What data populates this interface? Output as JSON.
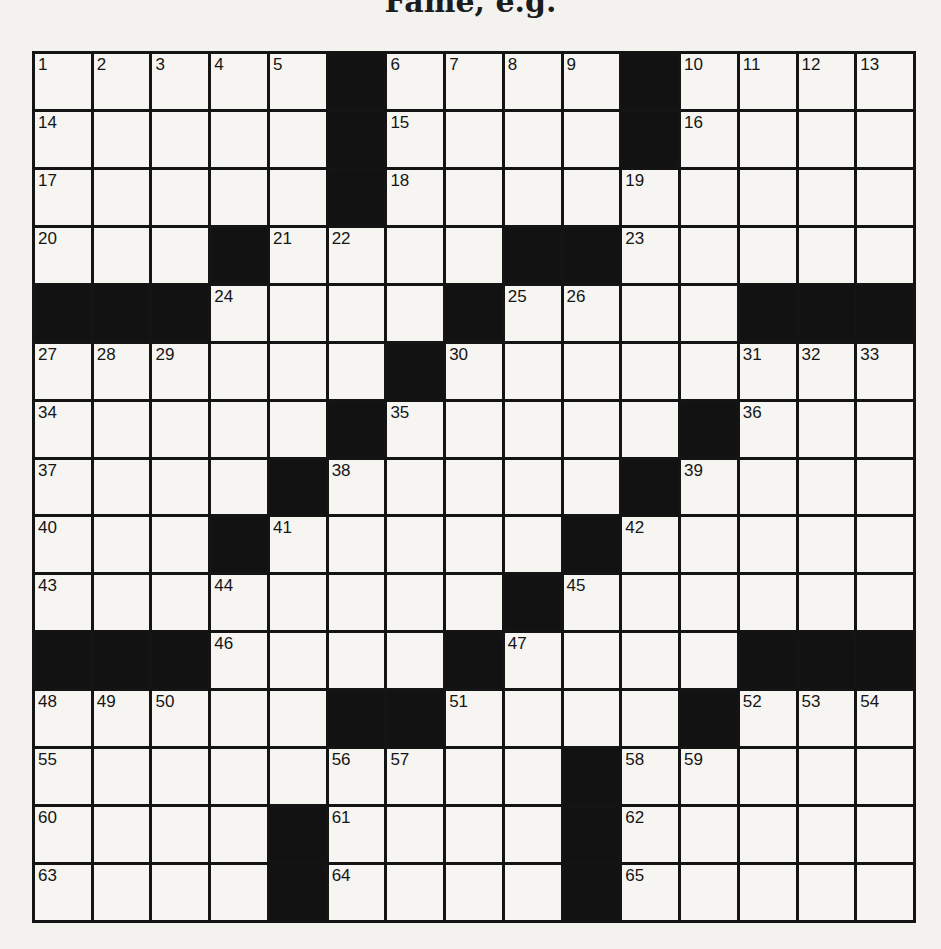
{
  "title": "Fame, e.g.",
  "puzzle": {
    "size": 15,
    "colors": {
      "block": "#121212",
      "cell": "#f6f5f2",
      "line": "#141414"
    },
    "rows": [
      "11111#1111#1111",
      "11111#1111#1111",
      "11111#111111111",
      "111#1111##11111",
      "###11111#1111###",
      "111111#11111111",
      "11111#11111#111",
      "1111#11111#1111",
      "111#11111#11111",
      "11111111#111111",
      "###1111#1111###",
      "11111##1111#111",
      "111111111#11111",
      "1111#1111#11111",
      "1111#1111#11111"
    ],
    "numbers": [
      [
        0,
        0,
        1
      ],
      [
        0,
        1,
        2
      ],
      [
        0,
        2,
        3
      ],
      [
        0,
        3,
        4
      ],
      [
        0,
        4,
        5
      ],
      [
        0,
        6,
        6
      ],
      [
        0,
        7,
        7
      ],
      [
        0,
        8,
        8
      ],
      [
        0,
        9,
        9
      ],
      [
        0,
        11,
        10
      ],
      [
        0,
        12,
        11
      ],
      [
        0,
        13,
        12
      ],
      [
        0,
        14,
        13
      ],
      [
        1,
        0,
        14
      ],
      [
        1,
        6,
        15
      ],
      [
        1,
        11,
        16
      ],
      [
        2,
        0,
        17
      ],
      [
        2,
        6,
        18
      ],
      [
        2,
        10,
        19
      ],
      [
        3,
        0,
        20
      ],
      [
        3,
        4,
        21
      ],
      [
        3,
        5,
        22
      ],
      [
        3,
        10,
        23
      ],
      [
        4,
        3,
        24
      ],
      [
        4,
        8,
        25
      ],
      [
        4,
        9,
        26
      ],
      [
        5,
        0,
        27
      ],
      [
        5,
        1,
        28
      ],
      [
        5,
        2,
        29
      ],
      [
        5,
        7,
        30
      ],
      [
        5,
        12,
        31
      ],
      [
        5,
        13,
        32
      ],
      [
        5,
        14,
        33
      ],
      [
        6,
        0,
        34
      ],
      [
        6,
        6,
        35
      ],
      [
        6,
        12,
        36
      ],
      [
        7,
        0,
        37
      ],
      [
        7,
        5,
        38
      ],
      [
        7,
        11,
        39
      ],
      [
        8,
        0,
        40
      ],
      [
        8,
        4,
        41
      ],
      [
        8,
        10,
        42
      ],
      [
        9,
        0,
        43
      ],
      [
        9,
        3,
        44
      ],
      [
        9,
        9,
        45
      ],
      [
        10,
        3,
        46
      ],
      [
        10,
        8,
        47
      ],
      [
        11,
        0,
        48
      ],
      [
        11,
        1,
        49
      ],
      [
        11,
        2,
        50
      ],
      [
        11,
        7,
        51
      ],
      [
        11,
        12,
        52
      ],
      [
        11,
        13,
        53
      ],
      [
        11,
        14,
        54
      ],
      [
        12,
        0,
        55
      ],
      [
        12,
        5,
        56
      ],
      [
        12,
        6,
        57
      ],
      [
        12,
        10,
        58
      ],
      [
        12,
        11,
        59
      ],
      [
        13,
        0,
        60
      ],
      [
        13,
        5,
        61
      ],
      [
        13,
        10,
        62
      ],
      [
        14,
        0,
        63
      ],
      [
        14,
        5,
        64
      ],
      [
        14,
        10,
        65
      ]
    ]
  }
}
